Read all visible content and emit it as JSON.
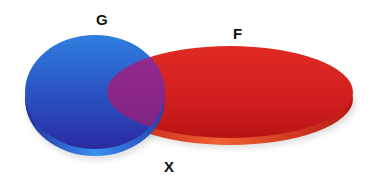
{
  "diagram": {
    "type": "venn",
    "sets": [
      {
        "id": "G",
        "label": "G",
        "color": "#2a5fd0",
        "edge_color": "#2f6de0"
      },
      {
        "id": "F",
        "label": "F",
        "color": "#d42020",
        "edge_color": "#c8261c"
      }
    ],
    "intersection": {
      "label": "X",
      "color": "#8a2a8a"
    }
  }
}
